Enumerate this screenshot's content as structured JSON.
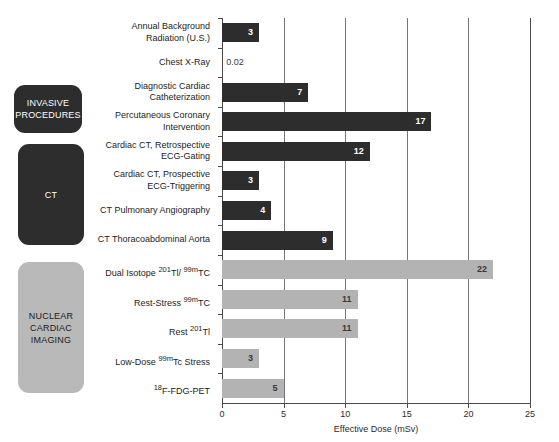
{
  "chart_data": {
    "type": "bar",
    "orientation": "horizontal",
    "title": "",
    "xlabel": "Effective Dose (mSv)",
    "ylabel": "",
    "xlim": [
      0,
      25
    ],
    "xticks": [
      0,
      5,
      10,
      15,
      20,
      25
    ],
    "xtick_labels": [
      "0",
      "5",
      "10",
      "15",
      "20",
      "25"
    ],
    "grid": true,
    "grid_axis": "x",
    "legend": "none",
    "categories": [
      "Annual Background Radiation (U.S.)",
      "Chest X-Ray",
      "Diagnostic Cardiac Catheterization",
      "Percutaneous Coronary Intervention",
      "Cardiac CT, Retrospective ECG-Gating",
      "Cardiac CT, Prospective ECG-Triggering",
      "CT Pulmonary Angiography",
      "CT Thoracoabdominal Aorta",
      "Dual Isotope 201Tl/ 99mTC",
      "Rest-Stress 99mTC",
      "Rest 201Tl",
      "Low-Dose 99mTc Stress",
      "18F-FDG-PET"
    ],
    "values": [
      3,
      0.02,
      7,
      17,
      12,
      3,
      4,
      9,
      22,
      11,
      11,
      3,
      5
    ],
    "value_labels": [
      "3",
      "0.02",
      "7",
      "17",
      "12",
      "3",
      "4",
      "9",
      "22",
      "11",
      "11",
      "3",
      "5"
    ],
    "colors": {
      "dark_bar": "#2d2d2d",
      "light_bar": "#b3b3b3",
      "axis": "#4a4a4a",
      "gridline": "#757575",
      "text": "#1c1c1c"
    }
  },
  "bars": [
    {
      "label_lines": [
        "Annual Background",
        "Radiation (U.S.)"
      ],
      "label_html": "Annual Background<br>Radiation (U.S.)",
      "value": 3,
      "value_label": "3",
      "style": "dark",
      "value_position": "inside"
    },
    {
      "label_lines": [
        "Chest X-Ray"
      ],
      "label_html": "Chest X-Ray",
      "value": 0.02,
      "value_label": "0.02",
      "style": "dark",
      "value_position": "outside"
    },
    {
      "label_lines": [
        "Diagnostic Cardiac",
        "Catheterization"
      ],
      "label_html": "Diagnostic Cardiac<br>Catheterization",
      "value": 7,
      "value_label": "7",
      "style": "dark",
      "value_position": "inside"
    },
    {
      "label_lines": [
        "Percutaneous Coronary",
        "Intervention"
      ],
      "label_html": "Percutaneous Coronary<br>Intervention",
      "value": 17,
      "value_label": "17",
      "style": "dark",
      "value_position": "inside"
    },
    {
      "label_lines": [
        "Cardiac CT, Retrospective",
        "ECG-Gating"
      ],
      "label_html": "Cardiac CT, Retrospective<br>ECG-Gating",
      "value": 12,
      "value_label": "12",
      "style": "dark",
      "value_position": "inside"
    },
    {
      "label_lines": [
        "Cardiac CT, Prospective",
        "ECG-Triggering"
      ],
      "label_html": "Cardiac CT, Prospective<br>ECG-Triggering",
      "value": 3,
      "value_label": "3",
      "style": "dark",
      "value_position": "inside"
    },
    {
      "label_lines": [
        "CT Pulmonary Angiography"
      ],
      "label_html": "CT Pulmonary Angiography",
      "value": 4,
      "value_label": "4",
      "style": "dark",
      "value_position": "inside"
    },
    {
      "label_lines": [
        "CT Thoracoabdominal Aorta"
      ],
      "label_html": "CT Thoracoabdominal Aorta",
      "value": 9,
      "value_label": "9",
      "style": "dark",
      "value_position": "inside"
    },
    {
      "label_lines": [
        "Dual Isotope 201Tl/ 99mTC"
      ],
      "label_html": "Dual Isotope <sup>201</sup>Tl/ <sup>99m</sup>TC",
      "value": 22,
      "value_label": "22",
      "style": "light",
      "value_position": "inside"
    },
    {
      "label_lines": [
        "Rest-Stress 99mTC"
      ],
      "label_html": "Rest-Stress <sup>99m</sup>TC",
      "value": 11,
      "value_label": "11",
      "style": "light",
      "value_position": "inside"
    },
    {
      "label_lines": [
        "Rest 201Tl"
      ],
      "label_html": "Rest <sup>201</sup>Tl",
      "value": 11,
      "value_label": "11",
      "style": "light",
      "value_position": "inside"
    },
    {
      "label_lines": [
        "Low-Dose 99mTc Stress"
      ],
      "label_html": "Low-Dose <sup>99m</sup>Tc Stress",
      "value": 3,
      "value_label": "3",
      "style": "light",
      "value_position": "inside"
    },
    {
      "label_lines": [
        "18F-FDG-PET"
      ],
      "label_html": "<sup>18</sup>F-FDG-PET",
      "value": 5,
      "value_label": "5",
      "style": "light",
      "value_position": "inside"
    }
  ],
  "category_boxes": [
    {
      "label_html": "INVASIVE<br>PROCEDURES",
      "text": "INVASIVE PROCEDURES",
      "style": "dark"
    },
    {
      "label_html": "CT",
      "text": "CT",
      "style": "dark"
    },
    {
      "label_html": "NUCLEAR<br>CARDIAC<br>IMAGING",
      "text": "NUCLEAR CARDIAC IMAGING",
      "style": "light"
    }
  ],
  "axis": {
    "x_title": "Effective Dose (mSv)",
    "tick_labels": [
      "0",
      "5",
      "10",
      "15",
      "20",
      "25"
    ]
  }
}
